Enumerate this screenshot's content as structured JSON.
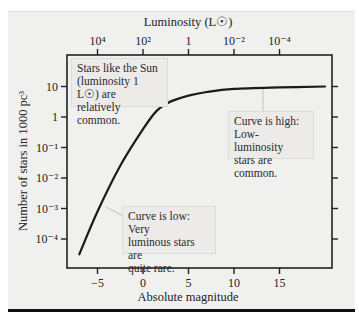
{
  "chart_data": {
    "type": "line",
    "title": "",
    "xlabel": "Absolute magnitude",
    "ylabel": "Number of stars in 1000 pc^3",
    "top_xlabel": "Luminosity (L☉)",
    "xlim": [
      -8,
      20
    ],
    "ylim_log10": [
      -4.9,
      1.9
    ],
    "x_ticks": [
      -5,
      0,
      5,
      10,
      15
    ],
    "x_tick_labels": [
      "−5",
      "0",
      "5",
      "10",
      "15"
    ],
    "top_x_ticks": [
      -5,
      0,
      5,
      10,
      15
    ],
    "top_x_tick_labels": [
      "10⁴",
      "10²",
      "1",
      "10⁻²",
      "10⁻⁴"
    ],
    "y_ticks_log10": [
      1,
      0,
      -1,
      -2,
      -3,
      -4
    ],
    "y_tick_labels": [
      "10",
      "1",
      "10⁻¹",
      "10⁻²",
      "10⁻³",
      "10⁻⁴"
    ],
    "y_scale": "log",
    "grid": false,
    "series": [
      {
        "name": "Luminosity function",
        "x": [
          -7,
          -5,
          -2.5,
          0,
          1.5,
          3,
          5,
          7,
          10,
          15,
          20
        ],
        "log10_y": [
          -4.5,
          -3.1,
          -1.6,
          -0.4,
          0.2,
          0.5,
          0.7,
          0.82,
          0.92,
          0.97,
          1.0
        ]
      }
    ],
    "annotations": [
      {
        "text": "Stars like the Sun (luminosity 1 L☉) are relatively common.",
        "points_to": [
          4.5,
          0.68
        ]
      },
      {
        "text": "Curve is high: Low-luminosity stars are common.",
        "points_to": [
          13,
          0.95
        ]
      },
      {
        "text": "Curve is low: Very luminous stars are quite rare.",
        "points_to": [
          -4,
          -2.9
        ]
      }
    ]
  },
  "labels": {
    "top_axis_title": "Luminosity (L☉)",
    "bottom_axis_title": "Absolute magnitude",
    "y_axis_title": "Number of stars in 1000 pc³"
  },
  "annotations": {
    "sun": [
      "Stars like the Sun",
      "(luminosity 1 L☉) are",
      "relatively common."
    ],
    "high": [
      "Curve is high:",
      "Low-luminosity",
      "stars are common."
    ],
    "low": [
      "Curve is low: Very",
      "luminous stars are",
      "quite rare."
    ]
  }
}
